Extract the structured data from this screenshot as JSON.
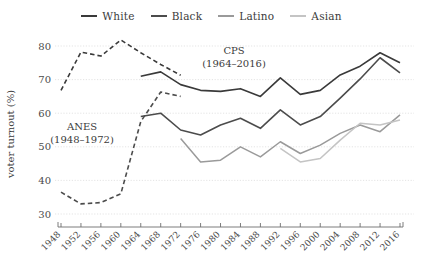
{
  "legend": {
    "position": "top-center",
    "entries": [
      {
        "label": "White",
        "color": "#3a3a3a"
      },
      {
        "label": "Black",
        "color": "#4c4c4c"
      },
      {
        "label": "Latino",
        "color": "#9a9a9a"
      },
      {
        "label": "Asian",
        "color": "#c4c4c4"
      }
    ]
  },
  "annotations": [
    {
      "name": "cps-label",
      "line1": "CPS",
      "line2": "(1964–2016)",
      "x": 234,
      "y": 54
    },
    {
      "name": "anes-label",
      "line1": "ANES",
      "line2": "(1948–1972)",
      "x": 82,
      "y": 130
    }
  ],
  "chart_data": {
    "type": "line",
    "title": "",
    "xlabel": "",
    "ylabel": "voter turnout (%)",
    "ylim": [
      30,
      80
    ],
    "yticks": [
      30,
      40,
      50,
      60,
      70,
      80
    ],
    "grid": true,
    "x": [
      1948,
      1952,
      1956,
      1960,
      1964,
      1968,
      1972,
      1976,
      1980,
      1984,
      1988,
      1992,
      1996,
      2000,
      2004,
      2008,
      2012,
      2016
    ],
    "categories": [
      "1948",
      "1952",
      "1956",
      "1960",
      "1964",
      "1968",
      "1972",
      "1976",
      "1980",
      "1984",
      "1988",
      "1992",
      "1996",
      "2000",
      "2004",
      "2008",
      "2012",
      "2016"
    ],
    "series": [
      {
        "name": "White (ANES)",
        "dataset": "ANES",
        "color": "#3a3a3a",
        "style": "dashed",
        "width": 1.6,
        "x": [
          1948,
          1952,
          1956,
          1960,
          1964,
          1968,
          1972
        ],
        "values": [
          66.8,
          78.2,
          77.0,
          81.8,
          78.0,
          74.5,
          71.3
        ]
      },
      {
        "name": "Black (ANES)",
        "dataset": "ANES",
        "color": "#4c4c4c",
        "style": "dashed",
        "width": 1.6,
        "x": [
          1948,
          1952,
          1956,
          1960,
          1964,
          1968,
          1972
        ],
        "values": [
          36.5,
          33.0,
          33.4,
          36.0,
          57.5,
          66.3,
          65.0
        ]
      },
      {
        "name": "White (CPS)",
        "dataset": "CPS",
        "color": "#3a3a3a",
        "style": "solid",
        "width": 1.6,
        "x": [
          1964,
          1968,
          1972,
          1976,
          1980,
          1984,
          1988,
          1992,
          1996,
          2000,
          2004,
          2008,
          2012,
          2016
        ],
        "values": [
          71.0,
          72.3,
          68.5,
          66.8,
          66.5,
          67.3,
          65.0,
          70.5,
          65.6,
          66.8,
          71.4,
          74.0,
          78.0,
          75.0
        ]
      },
      {
        "name": "Black (CPS)",
        "dataset": "CPS",
        "color": "#4c4c4c",
        "style": "solid",
        "width": 1.6,
        "x": [
          1964,
          1968,
          1972,
          1976,
          1980,
          1984,
          1988,
          1992,
          1996,
          2000,
          2004,
          2008,
          2012,
          2016
        ],
        "values": [
          59.0,
          60.0,
          55.0,
          53.5,
          56.5,
          58.5,
          55.5,
          61.0,
          56.5,
          59.0,
          64.5,
          70.2,
          76.5,
          72.0
        ]
      },
      {
        "name": "Latino (CPS)",
        "dataset": "CPS",
        "color": "#9a9a9a",
        "style": "solid",
        "width": 1.5,
        "x": [
          1972,
          1976,
          1980,
          1984,
          1988,
          1992,
          1996,
          2000,
          2004,
          2008,
          2012,
          2016
        ],
        "values": [
          52.5,
          45.5,
          46.0,
          50.0,
          47.0,
          51.5,
          48.0,
          50.5,
          54.0,
          56.5,
          54.5,
          59.5
        ]
      },
      {
        "name": "Asian (CPS)",
        "dataset": "CPS",
        "color": "#c4c4c4",
        "style": "solid",
        "width": 1.5,
        "x": [
          1992,
          1996,
          2000,
          2004,
          2008,
          2012,
          2016
        ],
        "values": [
          49.5,
          45.5,
          46.5,
          52.0,
          57.0,
          56.5,
          58.0
        ]
      }
    ]
  }
}
